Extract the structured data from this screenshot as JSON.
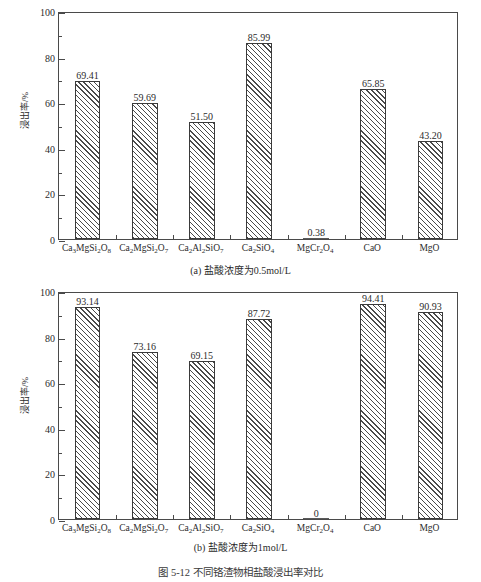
{
  "figure_caption": "图 5-12  不同铬渣物相盐酸浸出率对比",
  "panel_a": {
    "caption": "(a) 盐酸浓度为0.5mol/L"
  },
  "panel_b": {
    "caption": "(b) 盐酸浓度为1mol/L"
  },
  "chart_data": [
    {
      "type": "bar",
      "panel": "a",
      "title": "(a) 盐酸浓度为0.5mol/L",
      "xlabel": "",
      "ylabel": "浸出率/%",
      "ylim": [
        0,
        100
      ],
      "yticks": [
        0,
        20,
        40,
        60,
        80,
        100
      ],
      "ytick_labels": [
        "0",
        "20",
        "40",
        "60",
        "80",
        "100"
      ],
      "yminor_step": 10,
      "grid": false,
      "legend": "none",
      "categories": [
        "Ca3MgSi2O8",
        "Ca2MgSi2O7",
        "Ca2Al2SiO7",
        "Ca2SiO4",
        "MgCr2O4",
        "CaO",
        "MgO"
      ],
      "category_labels_html": [
        "Ca<sub>3</sub>MgSi<sub>2</sub>O<sub>8</sub>",
        "Ca<sub>2</sub>MgSi<sub>2</sub>O<sub>7</sub>",
        "Ca<sub>2</sub>Al<sub>2</sub>SiO<sub>7</sub>",
        "Ca<sub>2</sub>SiO<sub>4</sub>",
        "MgCr<sub>2</sub>O<sub>4</sub>",
        "CaO",
        "MgO"
      ],
      "values": [
        69.41,
        59.69,
        51.5,
        85.99,
        0.38,
        65.85,
        43.2
      ],
      "value_labels": [
        "69.41",
        "59.69",
        "51.50",
        "85.99",
        "0.38",
        "65.85",
        "43.20"
      ]
    },
    {
      "type": "bar",
      "panel": "b",
      "title": "(b) 盐酸浓度为1mol/L",
      "xlabel": "",
      "ylabel": "浸出率/%",
      "ylim": [
        0,
        100
      ],
      "yticks": [
        0,
        20,
        40,
        60,
        80,
        100
      ],
      "ytick_labels": [
        "0",
        "20",
        "40",
        "60",
        "80",
        "100"
      ],
      "yminor_step": 10,
      "grid": false,
      "legend": "none",
      "categories": [
        "Ca3MgSi2O8",
        "Ca2MgSi2O7",
        "Ca2Al2SiO7",
        "Ca2SiO4",
        "MgCr2O4",
        "CaO",
        "MgO"
      ],
      "category_labels_html": [
        "Ca<sub>3</sub>MgSi<sub>2</sub>O<sub>8</sub>",
        "Ca<sub>2</sub>MgSi<sub>2</sub>O<sub>7</sub>",
        "Ca<sub>2</sub>Al<sub>2</sub>SiO<sub>7</sub>",
        "Ca<sub>2</sub>SiO<sub>4</sub>",
        "MgCr<sub>2</sub>O<sub>4</sub>",
        "CaO",
        "MgO"
      ],
      "values": [
        93.14,
        73.16,
        69.15,
        87.72,
        0,
        94.41,
        90.93
      ],
      "value_labels": [
        "93.14",
        "73.16",
        "69.15",
        "87.72",
        "0",
        "94.41",
        "90.93"
      ]
    }
  ],
  "style": {
    "axis_color": "#4a4a4a",
    "bar_edge_color": "#3a3a3a",
    "hatch_color": "#4a4a4a",
    "text_color": "#2b2b2b",
    "background": "#ffffff"
  }
}
